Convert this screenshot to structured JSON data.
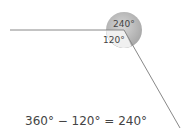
{
  "diagram": {
    "reflex_angle_label": "240°",
    "interior_angle_label": "120°",
    "equation": "360° − 120° = 240°",
    "colors": {
      "circle_fill": "#b8b8b8",
      "line": "#888888",
      "text": "#444444"
    }
  }
}
